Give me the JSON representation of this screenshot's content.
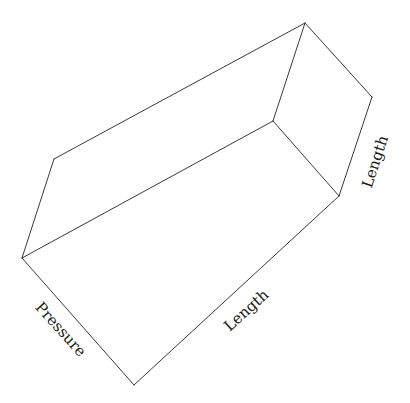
{
  "diagram": {
    "type": "3d-box-wireframe",
    "stroke_color": "#3a3a3a",
    "vertices": {
      "A": [
        54,
        159
      ],
      "B": [
        305,
        23
      ],
      "C": [
        372,
        97
      ],
      "D": [
        339,
        196
      ],
      "E": [
        273,
        121
      ],
      "F": [
        22,
        258
      ],
      "G": [
        134,
        385
      ]
    },
    "edges": [
      [
        "A",
        "B"
      ],
      [
        "B",
        "C"
      ],
      [
        "C",
        "D"
      ],
      [
        "B",
        "E"
      ],
      [
        "E",
        "D"
      ],
      [
        "E",
        "F"
      ],
      [
        "A",
        "F"
      ],
      [
        "F",
        "G"
      ],
      [
        "G",
        "D"
      ]
    ],
    "labels": {
      "pressure": {
        "text": "Pressure",
        "x": 60,
        "y": 330,
        "angle": 48
      },
      "length_front": {
        "text": "Length",
        "x": 247,
        "y": 311,
        "angle": -42
      },
      "length_side": {
        "text": "Length",
        "x": 376,
        "y": 162,
        "angle": -72
      }
    }
  }
}
